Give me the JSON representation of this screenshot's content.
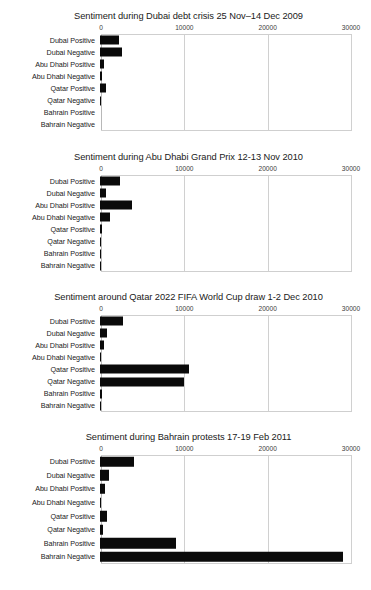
{
  "figure": {
    "kind": "multi-panel-bar-figure",
    "background": "#ffffff",
    "bar_color": "#0a0a0a",
    "grid_color": "#d0d0d0",
    "categories": [
      "Dubai Positive",
      "Dubai Negative",
      "Abu Dhabi Positive",
      "Abu Dhabi Negative",
      "Qatar Positive",
      "Qatar Negative",
      "Bahrain Positive",
      "Bahrain Negative"
    ],
    "tick_labels": [
      "0",
      "10000",
      "20000",
      "30000"
    ],
    "tick_values": [
      0,
      10000,
      20000,
      30000
    ]
  },
  "chart_data": [
    {
      "type": "bar",
      "orientation": "horizontal",
      "title": "Sentiment during Dubai debt crisis 25 Nov–14 Dec 2009",
      "xlabel": "",
      "ylabel": "",
      "xlim": [
        0,
        30000
      ],
      "grid": true,
      "legend": "none",
      "categories": [
        "Dubai Positive",
        "Dubai Negative",
        "Abu Dhabi Positive",
        "Abu Dhabi Negative",
        "Qatar Positive",
        "Qatar Negative",
        "Bahrain Positive",
        "Bahrain Negative"
      ],
      "values": [
        2300,
        2600,
        500,
        250,
        700,
        150,
        0,
        0
      ]
    },
    {
      "type": "bar",
      "orientation": "horizontal",
      "title": "Sentiment during Abu Dhabi Grand Prix 12-13 Nov 2010",
      "xlabel": "",
      "ylabel": "",
      "xlim": [
        0,
        30000
      ],
      "grid": true,
      "legend": "none",
      "categories": [
        "Dubai Positive",
        "Dubai Negative",
        "Abu Dhabi Positive",
        "Abu Dhabi Negative",
        "Qatar Positive",
        "Qatar Negative",
        "Bahrain Positive",
        "Bahrain Negative"
      ],
      "values": [
        2400,
        700,
        3800,
        1200,
        250,
        100,
        120,
        60
      ]
    },
    {
      "type": "bar",
      "orientation": "horizontal",
      "title": "Sentiment around Qatar 2022 FIFA World Cup draw 1-2 Dec 2010",
      "xlabel": "",
      "ylabel": "",
      "xlim": [
        0,
        30000
      ],
      "grid": true,
      "legend": "none",
      "categories": [
        "Dubai Positive",
        "Dubai Negative",
        "Abu Dhabi Positive",
        "Abu Dhabi Negative",
        "Qatar Positive",
        "Qatar Negative",
        "Bahrain Positive",
        "Bahrain Negative"
      ],
      "values": [
        2700,
        850,
        450,
        80,
        10700,
        10100,
        180,
        150
      ]
    },
    {
      "type": "bar",
      "orientation": "horizontal",
      "title": "Sentiment during Bahrain protests 17-19 Feb 2011",
      "xlabel": "",
      "ylabel": "",
      "xlim": [
        0,
        30000
      ],
      "grid": true,
      "legend": "none",
      "categories": [
        "Dubai Positive",
        "Dubai Negative",
        "Abu Dhabi Positive",
        "Abu Dhabi Negative",
        "Qatar Positive",
        "Qatar Negative",
        "Bahrain Positive",
        "Bahrain Negative"
      ],
      "values": [
        4100,
        1100,
        600,
        150,
        850,
        350,
        9100,
        29200
      ]
    }
  ]
}
